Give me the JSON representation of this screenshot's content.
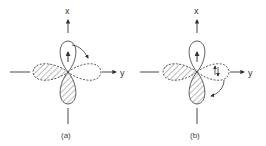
{
  "figure": {
    "panels": [
      {
        "id": "a",
        "caption": "(a)",
        "x_axis_label": "x",
        "y_axis_label": "y",
        "lobes": {
          "top": {
            "style": "solid",
            "hatched": false,
            "electron": "up-arrow"
          },
          "right": {
            "style": "dashed",
            "hatched": false
          },
          "bottom": {
            "style": "solid",
            "hatched": true
          },
          "left": {
            "style": "dashed",
            "hatched": true
          }
        },
        "transition_arrow": "from top lobe to right lobe"
      },
      {
        "id": "b",
        "caption": "(b)",
        "x_axis_label": "x",
        "y_axis_label": "y",
        "lobes": {
          "top": {
            "style": "solid",
            "hatched": false,
            "electron": "up-arrow"
          },
          "right": {
            "style": "dashed",
            "hatched": false,
            "electron": "up-down-arrows"
          },
          "bottom": {
            "style": "solid",
            "hatched": true
          },
          "left": {
            "style": "dashed",
            "hatched": true
          }
        },
        "transition_arrow": "from right lobe to bottom lobe"
      }
    ],
    "colors": {
      "stroke": "#333333",
      "hatch": "#555555",
      "background": "#ffffff"
    }
  }
}
